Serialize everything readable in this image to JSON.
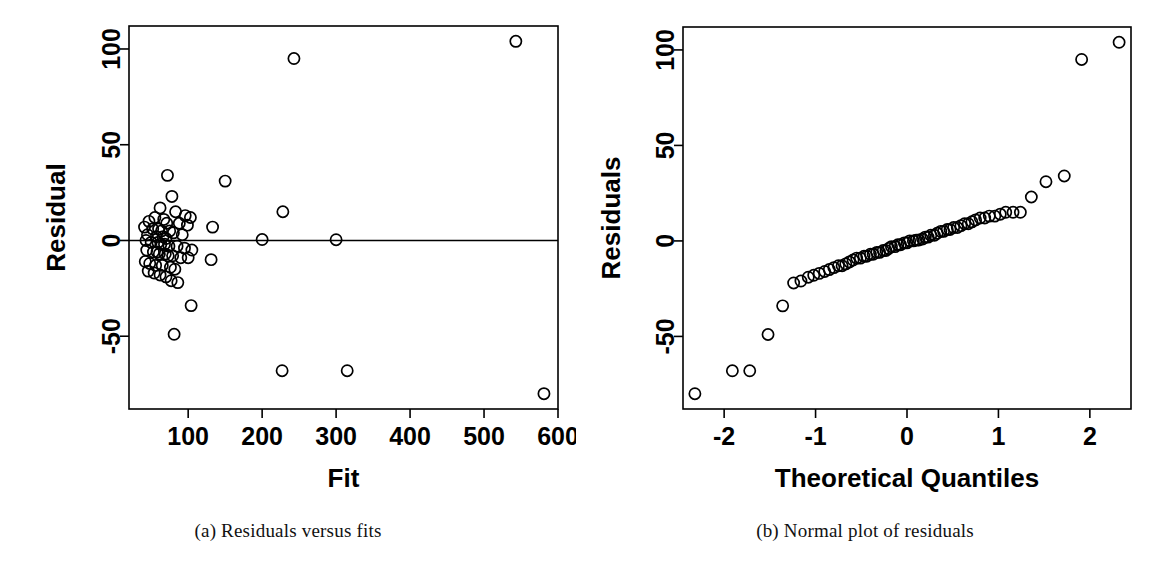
{
  "figure": {
    "background_color": "#ffffff",
    "foreground_color": "#000000",
    "panels": [
      {
        "id": "a",
        "caption": "(a) Residuals versus fits"
      },
      {
        "id": "b",
        "caption": "(b) Normal plot of residuals"
      }
    ]
  },
  "chart_data": [
    {
      "type": "scatter",
      "panel": "a",
      "title": "",
      "caption": "(a) Residuals versus fits",
      "xlabel": "Fit",
      "ylabel": "Residual",
      "grid": false,
      "legend": "none",
      "xlim": [
        20,
        600
      ],
      "ylim": [
        -88,
        112
      ],
      "xticks": [
        100,
        200,
        300,
        400,
        500,
        600
      ],
      "xtick_labels": [
        "100",
        "200",
        "300",
        "400",
        "500",
        "600"
      ],
      "yticks": [
        -50,
        0,
        50,
        100
      ],
      "ytick_labels": [
        "-50",
        "0",
        "50",
        "100"
      ],
      "reference_line": {
        "orientation": "horizontal",
        "y": 0
      },
      "points": [
        [
          543,
          104
        ],
        [
          243,
          95
        ],
        [
          72,
          34
        ],
        [
          150,
          31
        ],
        [
          78,
          23
        ],
        [
          228,
          15
        ],
        [
          62,
          17
        ],
        [
          83,
          15
        ],
        [
          96,
          13
        ],
        [
          103,
          12
        ],
        [
          47,
          10
        ],
        [
          55,
          12
        ],
        [
          67,
          11
        ],
        [
          71,
          9
        ],
        [
          88,
          9
        ],
        [
          99,
          8
        ],
        [
          133,
          7
        ],
        [
          41,
          7
        ],
        [
          52,
          6
        ],
        [
          60,
          6
        ],
        [
          64,
          5
        ],
        [
          75,
          5
        ],
        [
          80,
          4
        ],
        [
          92,
          3
        ],
        [
          45,
          3
        ],
        [
          57,
          2
        ],
        [
          66,
          2
        ],
        [
          70,
          1
        ],
        [
          200,
          0.5
        ],
        [
          300,
          0.4
        ],
        [
          43,
          0
        ],
        [
          50,
          -1
        ],
        [
          59,
          -1
        ],
        [
          63,
          -2
        ],
        [
          68,
          -2
        ],
        [
          74,
          -3
        ],
        [
          85,
          -3
        ],
        [
          95,
          -4
        ],
        [
          105,
          -5
        ],
        [
          44,
          -5
        ],
        [
          53,
          -6
        ],
        [
          58,
          -6
        ],
        [
          61,
          -7
        ],
        [
          69,
          -7
        ],
        [
          73,
          -8
        ],
        [
          79,
          -8
        ],
        [
          90,
          -9
        ],
        [
          100,
          -9
        ],
        [
          131,
          -10
        ],
        [
          42,
          -11
        ],
        [
          48,
          -12
        ],
        [
          56,
          -13
        ],
        [
          65,
          -13
        ],
        [
          76,
          -14
        ],
        [
          82,
          -15
        ],
        [
          46,
          -16
        ],
        [
          54,
          -17
        ],
        [
          62,
          -18
        ],
        [
          70,
          -19
        ],
        [
          77,
          -21
        ],
        [
          86,
          -22
        ],
        [
          104,
          -34
        ],
        [
          81,
          -49
        ],
        [
          227,
          -68
        ],
        [
          315,
          -68
        ],
        [
          581,
          -80
        ]
      ]
    },
    {
      "type": "scatter",
      "panel": "b",
      "title": "",
      "caption": "(b) Normal plot of residuals",
      "xlabel": "Theoretical Quantiles",
      "ylabel": "Residuals",
      "grid": false,
      "legend": "none",
      "xlim": [
        -2.45,
        2.45
      ],
      "ylim": [
        -88,
        112
      ],
      "xticks": [
        -2,
        -1,
        0,
        1,
        2
      ],
      "xtick_labels": [
        "-2",
        "-1",
        "0",
        "1",
        "2"
      ],
      "yticks": [
        -50,
        0,
        50,
        100
      ],
      "ytick_labels": [
        "-50",
        "0",
        "50",
        "100"
      ],
      "reference_line": null,
      "points": [
        [
          -2.32,
          -80
        ],
        [
          -1.91,
          -68
        ],
        [
          -1.72,
          -68
        ],
        [
          -1.52,
          -49
        ],
        [
          -1.36,
          -34
        ],
        [
          -1.24,
          -22
        ],
        [
          -1.16,
          -21
        ],
        [
          -1.08,
          -19
        ],
        [
          -1.02,
          -18
        ],
        [
          -0.96,
          -17
        ],
        [
          -0.9,
          -16
        ],
        [
          -0.85,
          -15
        ],
        [
          -0.8,
          -14
        ],
        [
          -0.75,
          -13
        ],
        [
          -0.71,
          -13
        ],
        [
          -0.67,
          -12
        ],
        [
          -0.63,
          -11
        ],
        [
          -0.59,
          -10
        ],
        [
          -0.55,
          -9
        ],
        [
          -0.51,
          -9
        ],
        [
          -0.47,
          -8
        ],
        [
          -0.44,
          -8
        ],
        [
          -0.4,
          -7
        ],
        [
          -0.37,
          -7
        ],
        [
          -0.33,
          -6
        ],
        [
          -0.3,
          -6
        ],
        [
          -0.26,
          -5
        ],
        [
          -0.23,
          -5
        ],
        [
          -0.2,
          -4
        ],
        [
          -0.17,
          -3
        ],
        [
          -0.13,
          -3
        ],
        [
          -0.1,
          -2
        ],
        [
          -0.07,
          -2
        ],
        [
          -0.03,
          -1
        ],
        [
          0.0,
          -1
        ],
        [
          0.03,
          0
        ],
        [
          0.07,
          0
        ],
        [
          0.1,
          0.4
        ],
        [
          0.13,
          0.5
        ],
        [
          0.17,
          1
        ],
        [
          0.2,
          2
        ],
        [
          0.23,
          2
        ],
        [
          0.26,
          3
        ],
        [
          0.3,
          3
        ],
        [
          0.33,
          4
        ],
        [
          0.37,
          5
        ],
        [
          0.4,
          5
        ],
        [
          0.44,
          6
        ],
        [
          0.47,
          6
        ],
        [
          0.51,
          7
        ],
        [
          0.55,
          7
        ],
        [
          0.59,
          8
        ],
        [
          0.63,
          9
        ],
        [
          0.67,
          9
        ],
        [
          0.71,
          10
        ],
        [
          0.75,
          11
        ],
        [
          0.8,
          12
        ],
        [
          0.85,
          12
        ],
        [
          0.9,
          13
        ],
        [
          0.96,
          13
        ],
        [
          1.02,
          14
        ],
        [
          1.08,
          15
        ],
        [
          1.16,
          15
        ],
        [
          1.24,
          15
        ],
        [
          1.36,
          23
        ],
        [
          1.52,
          31
        ],
        [
          1.72,
          34
        ],
        [
          1.91,
          95
        ],
        [
          2.32,
          104
        ]
      ]
    }
  ]
}
